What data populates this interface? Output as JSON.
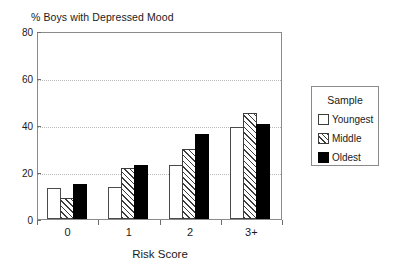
{
  "chart_data": {
    "type": "bar",
    "title": "% Boys with Depressed Mood",
    "xlabel": "Risk Score",
    "ylabel": "",
    "categories": [
      "0",
      "1",
      "2",
      "3+"
    ],
    "ylim": [
      0,
      80
    ],
    "yticks": [
      0,
      20,
      40,
      60,
      80
    ],
    "ytick_labels": [
      "0",
      "20",
      "40",
      "60",
      "80"
    ],
    "grid": true,
    "grid_axis": "y",
    "legend_position": "right-outside",
    "legend_title": "Sample",
    "series": [
      {
        "name": "Youngest",
        "values": [
          13,
          13.5,
          23,
          39
        ],
        "color": "#ffffff",
        "pattern": "solid-white-outline"
      },
      {
        "name": "Middle",
        "values": [
          9,
          21.5,
          30,
          45
        ],
        "color": "#3c3c3c",
        "pattern": "diagonal-hatch"
      },
      {
        "name": "Oldest",
        "values": [
          15,
          23,
          36,
          40.5
        ],
        "color": "#000000",
        "pattern": "solid-black"
      }
    ]
  },
  "legend": {
    "title": "Sample",
    "items": [
      {
        "label": "Youngest",
        "swatch": "white-square-icon"
      },
      {
        "label": "Middle",
        "swatch": "hatched-square-icon"
      },
      {
        "label": "Oldest",
        "swatch": "black-square-icon"
      }
    ]
  },
  "axes": {
    "y_tick_labels": [
      "80",
      "60",
      "40",
      "20",
      "0"
    ],
    "x_tick_labels": [
      "0",
      "1",
      "2",
      "3+"
    ],
    "x_title": "Risk Score"
  }
}
